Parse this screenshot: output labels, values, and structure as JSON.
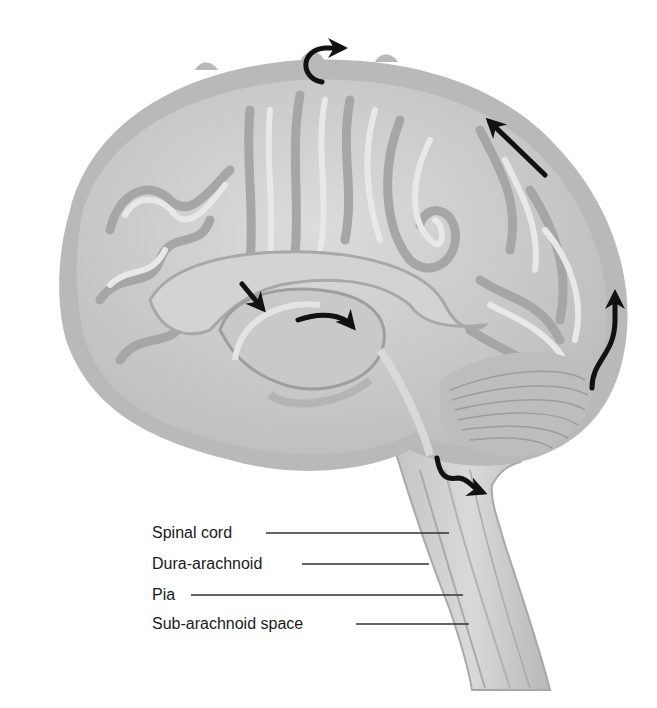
{
  "figure": {
    "colors": {
      "background": "#ffffff",
      "meninges": "#b9b9b9",
      "brain_fill": "#cfcfcf",
      "gyri_highlight": "#e6e6e6",
      "sulci_shadow": "#a4a4a4",
      "arrow": "#111111",
      "leader_line": "#333333",
      "label_text": "#1a1a1a"
    },
    "arrows": [
      {
        "name": "arrow-top-curl",
        "direction": "up-and-right over superior sagittal sinus"
      },
      {
        "name": "arrow-posterior-upper",
        "direction": "up-left along surface"
      },
      {
        "name": "arrow-posterior-lower",
        "direction": "upward along occipital surface"
      },
      {
        "name": "arrow-ventricle-entry",
        "direction": "down-right into ventricle"
      },
      {
        "name": "arrow-ventricle-curve",
        "direction": "curving right through ventricle"
      },
      {
        "name": "arrow-fourth-ventricle-exit",
        "direction": "down then right toward cisterna"
      }
    ]
  },
  "labels": [
    {
      "id": "spinal-cord",
      "text": "Spinal cord"
    },
    {
      "id": "dura-arachnoid",
      "text": "Dura-arachnoid"
    },
    {
      "id": "pia",
      "text": "Pia"
    },
    {
      "id": "sub-arachnoid-space",
      "text": "Sub-arachnoid space"
    }
  ]
}
